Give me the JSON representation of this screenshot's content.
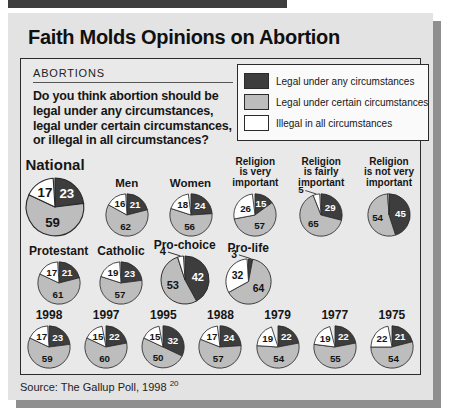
{
  "header": {
    "title": "Faith Molds Opinions on Abortion"
  },
  "box": {
    "kicker": "ABORTIONS",
    "question_lines": [
      "Do you think abortion should be",
      "legal under any circumstances,",
      "legal under certain circumstances,",
      "or illegal in all circumstances?"
    ]
  },
  "legend": {
    "items": [
      {
        "key": "any",
        "label": "Legal under any circumstances"
      },
      {
        "key": "certain",
        "label": "Legal under certain circumstances"
      },
      {
        "key": "illegal",
        "label": "Illegal in all circumstances"
      }
    ]
  },
  "source": {
    "text": "Source: The Gallup Poll, 1998",
    "superscript": "20"
  },
  "chart_data": {
    "type": "pie",
    "unit": "percent",
    "title": "Faith Molds Opinions on Abortion",
    "question": "Do you think abortion should be legal under any circumstances, legal under certain circumstances, or illegal in all circumstances?",
    "slice_order": [
      "any",
      "certain",
      "illegal"
    ],
    "colors": {
      "any": "#3d3d3d",
      "certain": "#bdbdbd",
      "illegal": "#ffffff"
    },
    "legend_labels": {
      "any": "Legal under any circumstances",
      "certain": "Legal under certain circumstances",
      "illegal": "Illegal in all circumstances"
    },
    "rows": [
      {
        "name": "demographics-and-religiosity",
        "pies": [
          {
            "label_lines": [
              "National"
            ],
            "size": 60,
            "big": true,
            "values": {
              "any": 23,
              "certain": 59,
              "illegal": 17
            }
          },
          {
            "label_lines": [
              "Men"
            ],
            "values": {
              "any": 21,
              "certain": 62,
              "illegal": 16
            }
          },
          {
            "label_lines": [
              "Women"
            ],
            "values": {
              "any": 24,
              "certain": 56,
              "illegal": 18
            }
          },
          {
            "label_lines": [
              "Religion",
              "is very",
              "important"
            ],
            "values": {
              "any": 15,
              "certain": 57,
              "illegal": 26
            }
          },
          {
            "label_lines": [
              "Religion",
              "is fairly",
              "important"
            ],
            "values": {
              "any": 29,
              "certain": 65,
              "illegal": 5
            },
            "callout": {
              "slice": "illegal"
            }
          },
          {
            "label_lines": [
              "Religion",
              "is not very",
              "important"
            ],
            "values": {
              "any": 45,
              "certain": 54,
              "illegal": 1
            },
            "hide_labels": [
              "illegal"
            ]
          }
        ]
      },
      {
        "name": "religion-and-stance",
        "pies": [
          {
            "label_lines": [
              "Protestant"
            ],
            "values": {
              "any": 21,
              "certain": 61,
              "illegal": 17
            }
          },
          {
            "label_lines": [
              "Catholic"
            ],
            "values": {
              "any": 23,
              "certain": 57,
              "illegal": 19
            }
          },
          {
            "label_lines": [
              "Pro-choice"
            ],
            "size": 50,
            "values": {
              "any": 42,
              "certain": 53,
              "illegal": 4
            },
            "callout": {
              "slice": "illegal"
            }
          },
          {
            "label_lines": [
              "Pro-life"
            ],
            "size": 47,
            "values": {
              "any": 3,
              "certain": 64,
              "illegal": 32
            },
            "callout": {
              "slice": "any"
            }
          }
        ]
      },
      {
        "name": "by-year",
        "pies": [
          {
            "label_lines": [
              "1998"
            ],
            "values": {
              "any": 23,
              "certain": 59,
              "illegal": 17
            }
          },
          {
            "label_lines": [
              "1997"
            ],
            "values": {
              "any": 22,
              "certain": 60,
              "illegal": 15
            }
          },
          {
            "label_lines": [
              "1995"
            ],
            "values": {
              "any": 32,
              "certain": 50,
              "illegal": 15
            }
          },
          {
            "label_lines": [
              "1988"
            ],
            "values": {
              "any": 24,
              "certain": 57,
              "illegal": 17
            }
          },
          {
            "label_lines": [
              "1979"
            ],
            "values": {
              "any": 22,
              "certain": 54,
              "illegal": 19
            }
          },
          {
            "label_lines": [
              "1977"
            ],
            "values": {
              "any": 22,
              "certain": 55,
              "illegal": 19
            }
          },
          {
            "label_lines": [
              "1975"
            ],
            "values": {
              "any": 21,
              "certain": 54,
              "illegal": 22
            }
          }
        ]
      }
    ]
  }
}
